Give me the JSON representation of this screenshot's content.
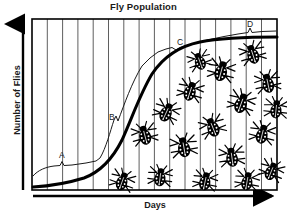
{
  "chart_data": {
    "type": "line",
    "title": "Fly Population",
    "xlabel": "Days",
    "ylabel": "Number of Flies",
    "grid": true,
    "gridlines_vertical": 16,
    "legend": "none",
    "annotations": [
      {
        "label": "A",
        "meaning": "lag phase",
        "x_px": 62,
        "y_px": 157
      },
      {
        "label": "B",
        "meaning": "exponential growth phase",
        "x_px": 112,
        "y_px": 118
      },
      {
        "label": "C",
        "meaning": "deceleration phase",
        "x_px": 180,
        "y_px": 44
      },
      {
        "label": "D",
        "meaning": "stationary / carrying capacity phase",
        "x_px": 250,
        "y_px": 26
      }
    ],
    "series": [
      {
        "name": "Fly population (S-shaped logistic growth curve)",
        "style": "thick-solid",
        "x": [
          0,
          5,
          10,
          15,
          20,
          25,
          30,
          35,
          40,
          45,
          50,
          55,
          60,
          65,
          70,
          75,
          80,
          85,
          90,
          95,
          100
        ],
        "y": [
          2,
          2,
          3,
          4,
          5,
          7,
          10,
          15,
          22,
          33,
          46,
          59,
          70,
          79,
          86,
          90,
          93,
          94,
          95,
          95,
          95
        ]
      },
      {
        "name": "Upper annotation/bracket outline",
        "style": "thin-solid",
        "x": [
          0,
          5,
          12,
          18,
          22,
          26,
          30,
          36,
          42,
          48,
          54,
          60,
          66,
          72,
          78,
          84,
          90,
          96,
          100
        ],
        "y": [
          8,
          9,
          12,
          17,
          20,
          24,
          36,
          52,
          66,
          77,
          84,
          88,
          91,
          93,
          95,
          96,
          97,
          97,
          97
        ]
      }
    ],
    "xlim": [
      0,
      100
    ],
    "ylim": [
      0,
      100
    ],
    "x_tick_labels": [],
    "y_tick_labels": []
  },
  "icons": {
    "fly": "fly-icon",
    "x_arrow": "right-arrow-icon",
    "y_arrow": "up-arrow-icon"
  },
  "colors": {
    "line": "#000000",
    "grid": "#555555",
    "frame": "#000000",
    "background": "#ffffff",
    "text": "#1a1a1a"
  },
  "flies": [
    {
      "x": 122,
      "y": 182,
      "r": 20,
      "s": 1.0
    },
    {
      "x": 145,
      "y": 136,
      "r": -15,
      "s": 1.05
    },
    {
      "x": 160,
      "y": 178,
      "r": 8,
      "s": 1.0
    },
    {
      "x": 166,
      "y": 113,
      "r": 25,
      "s": 1.05
    },
    {
      "x": 184,
      "y": 148,
      "r": -10,
      "s": 1.1
    },
    {
      "x": 190,
      "y": 92,
      "r": 18,
      "s": 1.05
    },
    {
      "x": 205,
      "y": 182,
      "r": 12,
      "s": 1.0
    },
    {
      "x": 213,
      "y": 128,
      "r": -22,
      "s": 1.05
    },
    {
      "x": 221,
      "y": 72,
      "r": 15,
      "s": 1.1
    },
    {
      "x": 232,
      "y": 158,
      "r": -8,
      "s": 1.05
    },
    {
      "x": 241,
      "y": 104,
      "r": 20,
      "s": 1.1
    },
    {
      "x": 247,
      "y": 182,
      "r": 10,
      "s": 1.0
    },
    {
      "x": 253,
      "y": 55,
      "r": -18,
      "s": 1.05
    },
    {
      "x": 262,
      "y": 135,
      "r": 14,
      "s": 1.05
    },
    {
      "x": 268,
      "y": 84,
      "r": -12,
      "s": 1.05
    },
    {
      "x": 271,
      "y": 172,
      "r": 22,
      "s": 1.0
    },
    {
      "x": 276,
      "y": 110,
      "r": 6,
      "s": 1.0
    },
    {
      "x": 200,
      "y": 62,
      "r": -20,
      "s": 0.95
    }
  ]
}
